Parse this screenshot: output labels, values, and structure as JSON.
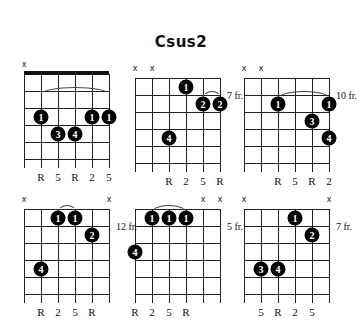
{
  "title": "Csus2",
  "layout": {
    "string_spacing": 17,
    "fret_spacing": 17,
    "strings": 6,
    "frets": 5
  },
  "diagrams": [
    {
      "id": "voicing-1",
      "name": "open-position",
      "x": 24,
      "y": 74,
      "nut": true,
      "fret_label": "",
      "mutes": [
        1
      ],
      "barre": {
        "fret": 2,
        "from": 2,
        "to": 6
      },
      "dots": [
        {
          "string": 2,
          "fret": 3,
          "finger": "1"
        },
        {
          "string": 5,
          "fret": 3,
          "finger": "1"
        },
        {
          "string": 6,
          "fret": 3,
          "finger": "1"
        },
        {
          "string": 3,
          "fret": 4,
          "finger": "3"
        },
        {
          "string": 4,
          "fret": 4,
          "finger": "4"
        }
      ],
      "note_labels": [
        {
          "string": 2,
          "text": "R"
        },
        {
          "string": 3,
          "text": "5"
        },
        {
          "string": 4,
          "text": "R"
        },
        {
          "string": 5,
          "text": "2"
        },
        {
          "string": 6,
          "text": "5"
        }
      ]
    },
    {
      "id": "voicing-2",
      "name": "seventh-fret-a",
      "x": 135,
      "y": 78,
      "nut": false,
      "fret_label": "7 fr.",
      "mutes": [
        1,
        2
      ],
      "barre": {
        "fret": 2,
        "from": 5,
        "to": 6
      },
      "dots": [
        {
          "string": 4,
          "fret": 1,
          "finger": "1"
        },
        {
          "string": 5,
          "fret": 2,
          "finger": "2"
        },
        {
          "string": 6,
          "fret": 2,
          "finger": "2"
        },
        {
          "string": 3,
          "fret": 4,
          "finger": "4"
        }
      ],
      "note_labels": [
        {
          "string": 3,
          "text": "R"
        },
        {
          "string": 4,
          "text": "2"
        },
        {
          "string": 5,
          "text": "5"
        },
        {
          "string": 6,
          "text": "R"
        }
      ]
    },
    {
      "id": "voicing-3",
      "name": "tenth-fret",
      "x": 244,
      "y": 78,
      "nut": false,
      "fret_label": "10 fr.",
      "mutes": [
        1,
        2
      ],
      "barre": {
        "fret": 2,
        "from": 3,
        "to": 6
      },
      "dots": [
        {
          "string": 3,
          "fret": 2,
          "finger": "1"
        },
        {
          "string": 6,
          "fret": 2,
          "finger": "1"
        },
        {
          "string": 5,
          "fret": 3,
          "finger": "3"
        },
        {
          "string": 6,
          "fret": 4,
          "finger": "4"
        }
      ],
      "note_labels": [
        {
          "string": 3,
          "text": "R"
        },
        {
          "string": 4,
          "text": "5"
        },
        {
          "string": 5,
          "text": "R"
        },
        {
          "string": 6,
          "text": "2"
        }
      ]
    },
    {
      "id": "voicing-4",
      "name": "twelfth-fret",
      "x": 24,
      "y": 209,
      "nut": false,
      "fret_label": "12 fr.",
      "mutes": [
        1,
        6
      ],
      "barre": {
        "fret": 1,
        "from": 3,
        "to": 4
      },
      "dots": [
        {
          "string": 3,
          "fret": 1,
          "finger": "1"
        },
        {
          "string": 4,
          "fret": 1,
          "finger": "1"
        },
        {
          "string": 5,
          "fret": 2,
          "finger": "2"
        },
        {
          "string": 2,
          "fret": 4,
          "finger": "4"
        }
      ],
      "note_labels": [
        {
          "string": 2,
          "text": "R"
        },
        {
          "string": 3,
          "text": "2"
        },
        {
          "string": 4,
          "text": "5"
        },
        {
          "string": 5,
          "text": "R"
        }
      ]
    },
    {
      "id": "voicing-5",
      "name": "fifth-fret",
      "x": 135,
      "y": 209,
      "nut": false,
      "fret_label": "5 fr.",
      "mutes": [
        5,
        6
      ],
      "barre": {
        "fret": 1,
        "from": 2,
        "to": 4
      },
      "dots": [
        {
          "string": 2,
          "fret": 1,
          "finger": "1"
        },
        {
          "string": 3,
          "fret": 1,
          "finger": "1"
        },
        {
          "string": 4,
          "fret": 1,
          "finger": "1"
        },
        {
          "string": 1,
          "fret": 3,
          "finger": "4"
        }
      ],
      "note_labels": [
        {
          "string": 1,
          "text": "R"
        },
        {
          "string": 2,
          "text": "2"
        },
        {
          "string": 3,
          "text": "5"
        },
        {
          "string": 4,
          "text": "R"
        }
      ]
    },
    {
      "id": "voicing-6",
      "name": "seventh-fret-b",
      "x": 244,
      "y": 209,
      "nut": false,
      "fret_label": "7 fr.",
      "mutes": [
        1,
        6
      ],
      "barre": null,
      "dots": [
        {
          "string": 4,
          "fret": 1,
          "finger": "1"
        },
        {
          "string": 5,
          "fret": 2,
          "finger": "2"
        },
        {
          "string": 2,
          "fret": 4,
          "finger": "3"
        },
        {
          "string": 3,
          "fret": 4,
          "finger": "4"
        }
      ],
      "note_labels": [
        {
          "string": 2,
          "text": "5"
        },
        {
          "string": 3,
          "text": "R"
        },
        {
          "string": 4,
          "text": "2"
        },
        {
          "string": 5,
          "text": "5"
        }
      ]
    }
  ]
}
